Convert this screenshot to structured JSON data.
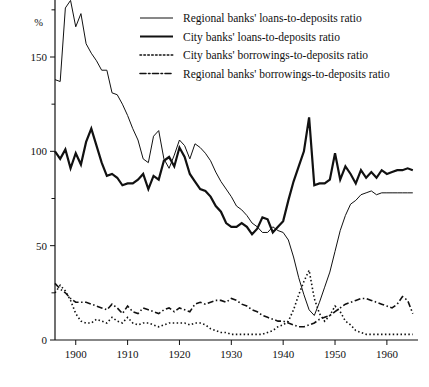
{
  "chart_data": {
    "type": "line",
    "title": "",
    "subtitle": "",
    "xlabel": "",
    "ylabel": "%",
    "y_unit_label": "%",
    "xlim": [
      1896,
      1966
    ],
    "ylim": [
      0,
      180
    ],
    "y_ticks": [
      0,
      50,
      100,
      150
    ],
    "y_tick_labels": [
      "0",
      "50",
      "100",
      "150"
    ],
    "y_minor_ticks": [
      25,
      75,
      125,
      175
    ],
    "x_ticks": [
      1900,
      1910,
      1920,
      1930,
      1940,
      1950,
      1960
    ],
    "x_tick_labels": [
      "1900",
      "1910",
      "1920",
      "1930",
      "1940",
      "1950",
      "1960"
    ],
    "grid": false,
    "legend_position": "top-right",
    "series": [
      {
        "name": "Regional banks' loans-to-deposits ratio",
        "style": "solid-thin",
        "stroke_width": 1.0,
        "dash": "none",
        "color": "#111111",
        "x": [
          1896,
          1897,
          1898,
          1899,
          1900,
          1901,
          1902,
          1903,
          1904,
          1905,
          1906,
          1907,
          1908,
          1909,
          1910,
          1911,
          1912,
          1913,
          1914,
          1915,
          1916,
          1917,
          1918,
          1919,
          1920,
          1921,
          1922,
          1923,
          1924,
          1925,
          1926,
          1927,
          1928,
          1929,
          1930,
          1931,
          1932,
          1933,
          1934,
          1935,
          1936,
          1937,
          1938,
          1939,
          1940,
          1941,
          1942,
          1943,
          1944,
          1945,
          1946,
          1947,
          1948,
          1949,
          1950,
          1951,
          1952,
          1953,
          1954,
          1955,
          1956,
          1957,
          1958,
          1959,
          1960,
          1961,
          1962,
          1963,
          1964,
          1965
        ],
        "values": [
          138,
          137,
          176,
          180,
          166,
          173,
          157,
          152,
          148,
          143,
          143,
          131,
          130,
          125,
          119,
          112,
          106,
          96,
          94,
          108,
          111,
          96,
          91,
          98,
          106,
          103,
          96,
          104,
          102,
          99,
          95,
          89,
          84,
          80,
          76,
          71,
          69,
          66,
          62,
          60,
          57,
          57,
          60,
          58,
          57,
          53,
          44,
          33,
          24,
          16,
          13,
          20,
          28,
          36,
          47,
          58,
          66,
          72,
          74,
          77,
          78,
          79,
          77,
          78,
          78,
          78,
          78,
          78,
          78,
          78
        ]
      },
      {
        "name": "City banks' loans-to-deposits ratio",
        "style": "solid-thick",
        "stroke_width": 2.2,
        "dash": "none",
        "color": "#111111",
        "x": [
          1896,
          1897,
          1898,
          1899,
          1900,
          1901,
          1902,
          1903,
          1904,
          1905,
          1906,
          1907,
          1908,
          1909,
          1910,
          1911,
          1912,
          1913,
          1914,
          1915,
          1916,
          1917,
          1918,
          1919,
          1920,
          1921,
          1922,
          1923,
          1924,
          1925,
          1926,
          1927,
          1928,
          1929,
          1930,
          1931,
          1932,
          1933,
          1934,
          1935,
          1936,
          1937,
          1938,
          1939,
          1940,
          1941,
          1942,
          1943,
          1944,
          1945,
          1946,
          1947,
          1948,
          1949,
          1950,
          1951,
          1952,
          1953,
          1954,
          1955,
          1956,
          1957,
          1958,
          1959,
          1960,
          1961,
          1962,
          1963,
          1964,
          1965
        ],
        "values": [
          100,
          96,
          101,
          91,
          99,
          93,
          105,
          112,
          103,
          94,
          87,
          88,
          86,
          82,
          83,
          83,
          85,
          88,
          80,
          87,
          85,
          95,
          97,
          92,
          102,
          97,
          88,
          84,
          80,
          79,
          76,
          71,
          68,
          62,
          60,
          60,
          62,
          60,
          56,
          59,
          65,
          64,
          57,
          60,
          63,
          74,
          84,
          92,
          100,
          118,
          82,
          83,
          83,
          85,
          99,
          85,
          92,
          88,
          83,
          90,
          86,
          89,
          86,
          90,
          88,
          89,
          90,
          90,
          91,
          90
        ]
      },
      {
        "name": "City banks' borrowings-to-deposits ratio",
        "style": "dotted",
        "stroke_width": 1.6,
        "dash": "1.5,2.4",
        "color": "#111111",
        "x": [
          1896,
          1897,
          1898,
          1899,
          1900,
          1901,
          1902,
          1903,
          1904,
          1905,
          1906,
          1907,
          1908,
          1909,
          1910,
          1911,
          1912,
          1913,
          1914,
          1915,
          1916,
          1917,
          1918,
          1919,
          1920,
          1921,
          1922,
          1923,
          1924,
          1925,
          1926,
          1927,
          1928,
          1929,
          1930,
          1931,
          1932,
          1933,
          1934,
          1935,
          1936,
          1937,
          1938,
          1939,
          1940,
          1941,
          1942,
          1943,
          1944,
          1945,
          1946,
          1947,
          1948,
          1949,
          1950,
          1951,
          1952,
          1953,
          1954,
          1955,
          1956,
          1957,
          1958,
          1959,
          1960,
          1961,
          1962,
          1963,
          1964,
          1965
        ],
        "values": [
          25,
          29,
          26,
          21,
          14,
          10,
          9,
          9,
          11,
          10,
          9,
          12,
          10,
          9,
          12,
          9,
          8,
          9,
          9,
          8,
          7,
          8,
          9,
          9,
          9,
          9,
          8,
          9,
          9,
          8,
          6,
          5,
          4,
          4,
          3,
          3,
          3,
          3,
          3,
          3,
          3,
          4,
          5,
          7,
          8,
          10,
          16,
          24,
          31,
          37,
          22,
          14,
          10,
          13,
          18,
          15,
          10,
          8,
          5,
          4,
          3,
          3,
          3,
          3,
          3,
          3,
          3,
          3,
          3,
          3
        ]
      },
      {
        "name": "Regional banks' borrowings-to-deposits ratio",
        "style": "dash-dot",
        "stroke_width": 1.6,
        "dash": "6,2.5,1.5,2.5",
        "color": "#111111",
        "x": [
          1896,
          1897,
          1898,
          1899,
          1900,
          1901,
          1902,
          1903,
          1904,
          1905,
          1906,
          1907,
          1908,
          1909,
          1910,
          1911,
          1912,
          1913,
          1914,
          1915,
          1916,
          1917,
          1918,
          1919,
          1920,
          1921,
          1922,
          1923,
          1924,
          1925,
          1926,
          1927,
          1928,
          1929,
          1930,
          1931,
          1932,
          1933,
          1934,
          1935,
          1936,
          1937,
          1938,
          1939,
          1940,
          1941,
          1942,
          1943,
          1944,
          1945,
          1946,
          1947,
          1948,
          1949,
          1950,
          1951,
          1952,
          1953,
          1954,
          1955,
          1956,
          1957,
          1958,
          1959,
          1960,
          1961,
          1962,
          1963,
          1964,
          1965
        ],
        "values": [
          30,
          27,
          25,
          22,
          20,
          20,
          20,
          19,
          18,
          17,
          16,
          19,
          17,
          14,
          18,
          15,
          14,
          17,
          16,
          15,
          14,
          16,
          17,
          15,
          17,
          16,
          15,
          19,
          20,
          19,
          20,
          21,
          21,
          20,
          22,
          21,
          19,
          18,
          16,
          15,
          13,
          12,
          11,
          10,
          10,
          9,
          8,
          7,
          7,
          8,
          9,
          11,
          12,
          13,
          15,
          17,
          19,
          20,
          21,
          22,
          22,
          21,
          20,
          19,
          18,
          17,
          19,
          23,
          21,
          14
        ]
      }
    ],
    "legend_entries": [
      {
        "label": "Regional banks' loans-to-deposits ratio",
        "style": "solid-thin"
      },
      {
        "label": "City banks' loans-to-deposits ratio",
        "style": "solid-thick"
      },
      {
        "label": "City banks' borrowings-to-deposits ratio",
        "style": "dotted"
      },
      {
        "label": "Regional banks' borrowings-to-deposits ratio",
        "style": "dash-dot"
      }
    ]
  }
}
